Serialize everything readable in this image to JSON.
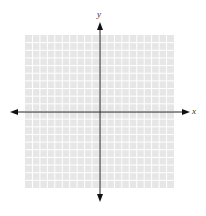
{
  "diagram": {
    "type": "coordinate-plane",
    "grid": {
      "columns": 20,
      "rows": 20,
      "left": 25,
      "top": 35,
      "right": 174,
      "bottom": 188,
      "fill": "#e6e6e6",
      "line_color": "#ffffff"
    },
    "origin": {
      "x": 100,
      "y": 112
    },
    "axes": {
      "x": {
        "label": "x",
        "from": 10,
        "to": 190,
        "color": "#222222"
      },
      "y": {
        "label": "y",
        "from": 22,
        "to": 202,
        "color": "#222222"
      }
    }
  }
}
